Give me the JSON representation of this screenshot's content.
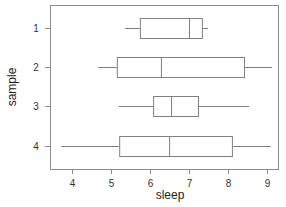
{
  "chart_data": {
    "type": "boxplot",
    "orientation": "horizontal",
    "title": "",
    "xlabel": "sleep",
    "ylabel": "sample",
    "xlim": [
      3.45,
      9.3
    ],
    "x_ticks": [
      4,
      5,
      6,
      7,
      8,
      9
    ],
    "categories": [
      "1",
      "2",
      "3",
      "4"
    ],
    "series": [
      {
        "name": "1",
        "lower_whisker": 5.36,
        "q1": 5.74,
        "median": 7.0,
        "q3": 7.33,
        "upper_whisker": 7.49
      },
      {
        "name": "2",
        "lower_whisker": 4.67,
        "q1": 5.15,
        "median": 6.28,
        "q3": 8.41,
        "upper_whisker": 9.13
      },
      {
        "name": "3",
        "lower_whisker": 5.2,
        "q1": 6.08,
        "median": 6.54,
        "q3": 7.23,
        "upper_whisker": 8.54
      },
      {
        "name": "4",
        "lower_whisker": 3.72,
        "q1": 5.21,
        "median": 6.49,
        "q3": 8.1,
        "upper_whisker": 9.1
      }
    ],
    "grid": false,
    "legend": null
  },
  "colors": {
    "line": "#808080",
    "frame": "#8c8c8c",
    "text": "#333333"
  }
}
